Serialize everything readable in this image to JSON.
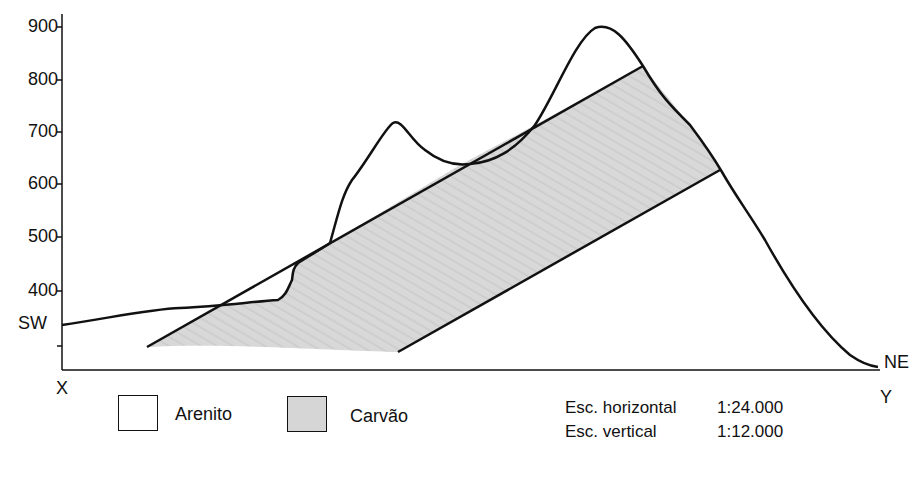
{
  "diagram": {
    "type": "geological-cross-section",
    "y_axis": {
      "ticks": [
        {
          "label": "900",
          "y": 27
        },
        {
          "label": "800",
          "y": 80
        },
        {
          "label": "700",
          "y": 132
        },
        {
          "label": "600",
          "y": 184
        },
        {
          "label": "500",
          "y": 237
        },
        {
          "label": "400",
          "y": 291
        },
        {
          "label": "",
          "y": 346
        }
      ]
    },
    "labels": {
      "sw": "SW",
      "ne": "NE",
      "x_point": "X",
      "y_point": "Y"
    },
    "legend": [
      {
        "label": "Arenito",
        "color": "#ffffff"
      },
      {
        "label": "Carvão",
        "color": "#d6d6d6"
      }
    ],
    "scales": {
      "horizontal_label": "Esc. horizontal",
      "horizontal_value": "1:24.000",
      "vertical_label": "Esc. vertical",
      "vertical_value": "1:12.000"
    },
    "colors": {
      "line": "#111111",
      "coal_fill": "#d6d6d6",
      "sandstone_fill": "#ffffff"
    }
  }
}
